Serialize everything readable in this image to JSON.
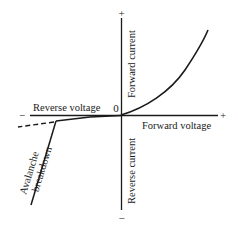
{
  "diagram": {
    "type": "diode-iv-characteristic",
    "axes": {
      "x_positive_label": "Forward voltage",
      "x_negative_label": "Reverse voltage",
      "y_positive_label": "Forward current",
      "y_negative_label": "Reverse current",
      "origin_label": "0",
      "plus_sign": "+",
      "minus_sign": "−"
    },
    "annotations": {
      "breakdown_line1": "Avalanche",
      "breakdown_line2": "breakdown"
    },
    "colors": {
      "ink": "#1a1a1a",
      "background": "#ffffff"
    }
  }
}
